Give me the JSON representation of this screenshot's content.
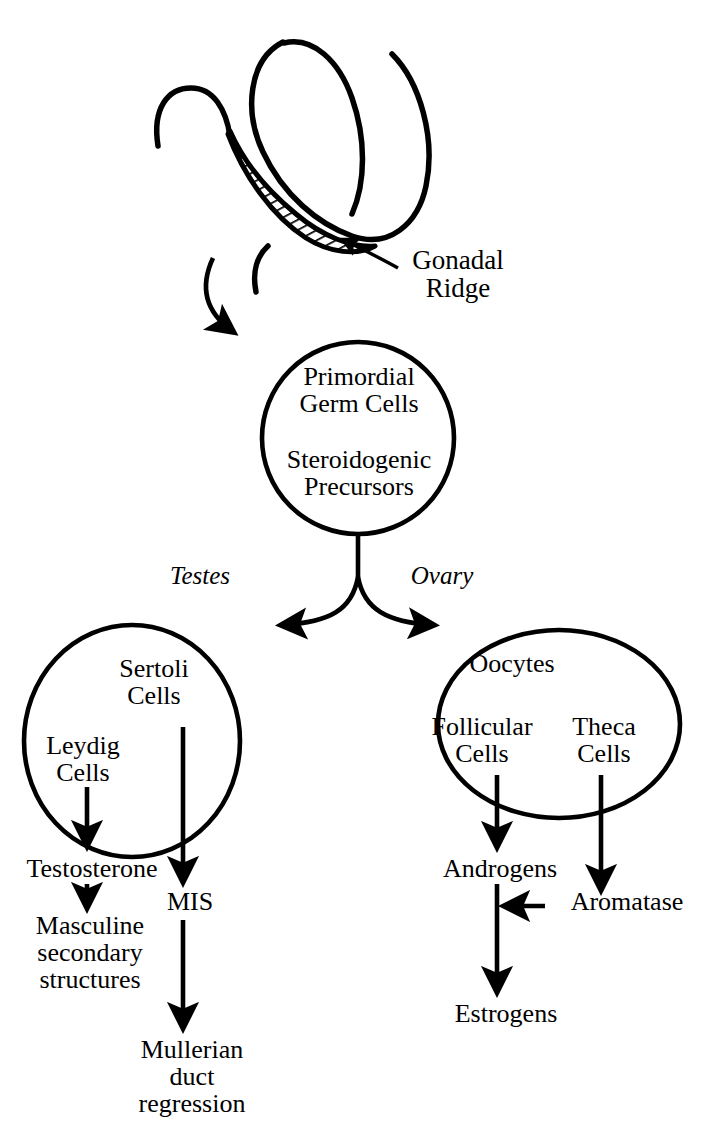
{
  "diagram": {
    "colors": {
      "ink": "#000000",
      "background": "#ffffff"
    },
    "embryo": {
      "gonadal_ridge_label": "Gonadal\nRidge",
      "hatch_region_name": "gonadal-ridge-hatched-crescent"
    },
    "nodes": {
      "primordial": {
        "line1": "Primordial\nGerm Cells",
        "line2": "Steroidogenic\nPrecursors"
      },
      "testes_branch_label": "Testes",
      "ovary_branch_label": "Ovary",
      "testes": {
        "sertoli": "Sertoli\nCells",
        "leydig": "Leydig\nCells"
      },
      "ovary": {
        "oocytes": "Oocytes",
        "follicular": "Follicular\nCells",
        "theca": "Theca\nCells"
      }
    },
    "products": {
      "testosterone": "Testosterone",
      "masculine": "Masculine\nsecondary\nstructures",
      "mis": "MIS",
      "mullerian": "Mullerian\nduct\nregression",
      "androgens": "Androgens",
      "aromatase": "Aromatase",
      "estrogens": "Estrogens"
    }
  }
}
